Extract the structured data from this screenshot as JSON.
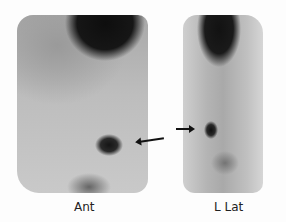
{
  "image": {
    "type": "nuclear medicine scintigraphy",
    "views": [
      {
        "id": "ant",
        "label": "Ant"
      },
      {
        "id": "lat",
        "label": "L Lat"
      }
    ],
    "annotations": [
      {
        "type": "arrow",
        "view": "ant",
        "direction": "left",
        "points_to": "focal uptake"
      },
      {
        "type": "arrow",
        "view": "lat",
        "direction": "right",
        "points_to": "focal uptake"
      }
    ],
    "colors": {
      "background": "#fdfdfd",
      "uptake": "#111111",
      "tissue": "#b8b8b8"
    }
  }
}
